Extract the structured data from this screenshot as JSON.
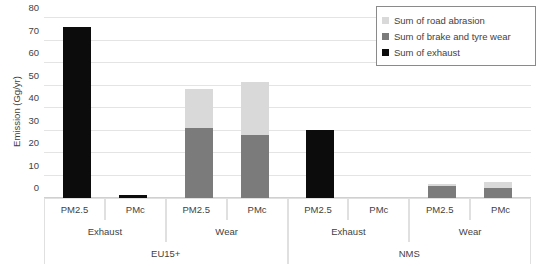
{
  "chart_data": {
    "type": "bar",
    "stacked": true,
    "title": "",
    "xlabel": "",
    "ylabel": "Emission (Gg/yr)",
    "ylim": [
      0,
      80
    ],
    "yticks": [
      0,
      10,
      20,
      30,
      40,
      50,
      60,
      70,
      80
    ],
    "ytick_labels": [
      "0",
      "10",
      "20",
      "30",
      "40",
      "50",
      "60",
      "70",
      "80"
    ],
    "grid": true,
    "legend_position": "top-right",
    "categories": [
      "PM2.5",
      "PMc",
      "PM2.5",
      "PMc",
      "PM2.5",
      "PMc",
      "PM2.5",
      "PMc"
    ],
    "group_tier2": [
      "Exhaust",
      "Wear",
      "Exhaust",
      "Wear"
    ],
    "group_tier3": [
      "EU15+",
      "NMS"
    ],
    "series": [
      {
        "name": "Sum of exhaust",
        "color": "#0c0c0c",
        "values": [
          76.0,
          1.3,
          0,
          0,
          30.4,
          0,
          0,
          0
        ]
      },
      {
        "name": "Sum of brake and tyre wear",
        "color": "#7b7b7b",
        "values": [
          0,
          0,
          31.0,
          28.0,
          0,
          0,
          5.5,
          4.5
        ]
      },
      {
        "name": "Sum of road abrasion",
        "color": "#d9d9d9",
        "values": [
          0,
          0,
          17.5,
          23.5,
          0,
          0,
          0.3,
          2.5
        ]
      }
    ],
    "bar_totals": [
      76.0,
      1.3,
      48.5,
      51.5,
      30.4,
      0,
      5.8,
      7.0
    ]
  },
  "legend": {
    "items": [
      {
        "label": "Sum of road abrasion",
        "color": "#d9d9d9"
      },
      {
        "label": "Sum of brake and tyre wear",
        "color": "#7b7b7b"
      },
      {
        "label": "Sum of exhaust",
        "color": "#0c0c0c"
      }
    ]
  },
  "axis": {
    "y_title": "Emission (Gg/yr)",
    "y_labels": [
      "80",
      "70",
      "60",
      "50",
      "40",
      "30",
      "20",
      "10",
      "0"
    ],
    "tier1": [
      "PM2.5",
      "PMc",
      "PM2.5",
      "PMc",
      "PM2.5",
      "PMc",
      "PM2.5",
      "PMc"
    ],
    "tier2": [
      "Exhaust",
      "Wear",
      "Exhaust",
      "Wear"
    ],
    "tier3": [
      "EU15+",
      "NMS"
    ]
  }
}
